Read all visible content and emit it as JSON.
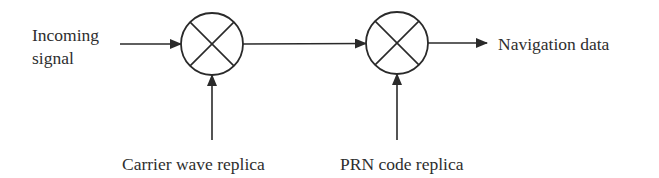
{
  "diagram": {
    "labels": {
      "input": [
        "Incoming",
        "signal"
      ],
      "output": "Navigation data",
      "carrier_replica": "Carrier wave replica",
      "prn_replica": "PRN code replica"
    },
    "nodes": [
      {
        "id": "mixer-1",
        "type": "multiplier",
        "symbol": "circle-x",
        "cx": 212,
        "cy": 44,
        "r": 31
      },
      {
        "id": "mixer-2",
        "type": "multiplier",
        "symbol": "circle-x",
        "cx": 397,
        "cy": 43,
        "r": 31
      }
    ],
    "edges": [
      {
        "from": "Incoming signal",
        "to": "mixer-1",
        "direction": "right"
      },
      {
        "from": "mixer-1",
        "to": "mixer-2",
        "direction": "right"
      },
      {
        "from": "mixer-2",
        "to": "Navigation data",
        "direction": "right"
      },
      {
        "from": "Carrier wave replica",
        "to": "mixer-1",
        "direction": "up"
      },
      {
        "from": "PRN code replica",
        "to": "mixer-2",
        "direction": "up"
      }
    ],
    "colors": {
      "stroke": "#2a2a2a",
      "text": "#2e2e2e",
      "background": "#ffffff"
    }
  }
}
